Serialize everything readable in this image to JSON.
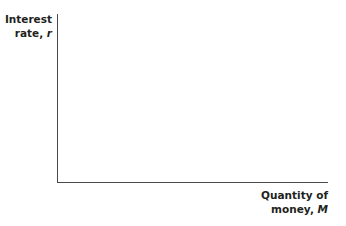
{
  "chart_data": {
    "type": "line",
    "title": "",
    "xlabel": "Quantity of money, M",
    "ylabel": "Interest rate, r",
    "series": [],
    "grid": false,
    "legend": null
  },
  "labels": {
    "y_line1": "Interest",
    "y_line2_text": "rate, ",
    "y_var": "r",
    "x_line1": "Quantity of",
    "x_line2_text": "money, ",
    "x_var": "M"
  }
}
